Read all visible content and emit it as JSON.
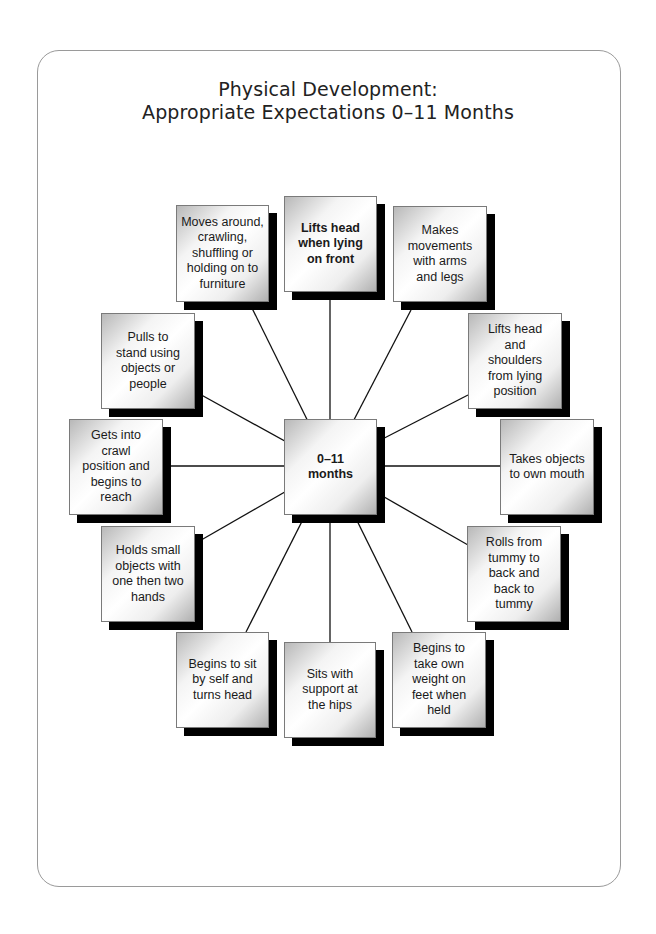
{
  "title": {
    "line1": "Physical Development:",
    "line2": "Appropriate Expectations 0–11 Months"
  },
  "center": {
    "label": "0–11 months",
    "bold": true
  },
  "nodes": [
    {
      "id": "lifts-head-front",
      "label": "Lifts head when lying on front",
      "bold": true
    },
    {
      "id": "makes-movements",
      "label": "Makes movements with arms and legs"
    },
    {
      "id": "lifts-head-shoulders",
      "label": "Lifts head and shoulders from lying position"
    },
    {
      "id": "takes-objects-mouth",
      "label": "Takes objects to own mouth"
    },
    {
      "id": "rolls-tummy",
      "label": "Rolls from tummy to back and back to tummy"
    },
    {
      "id": "takes-weight",
      "label": "Begins to take own weight on feet when held"
    },
    {
      "id": "sits-support",
      "label": "Sits with support at the hips"
    },
    {
      "id": "sit-by-self",
      "label": "Begins to sit by self and turns head"
    },
    {
      "id": "holds-objects",
      "label": "Holds small objects with one then two hands"
    },
    {
      "id": "crawl-position",
      "label": "Gets into crawl position and begins to reach"
    },
    {
      "id": "pulls-to-stand",
      "label": "Pulls to stand using objects or people"
    },
    {
      "id": "moves-around",
      "label": "Moves around, crawling, shuffling or holding on to furniture"
    }
  ]
}
